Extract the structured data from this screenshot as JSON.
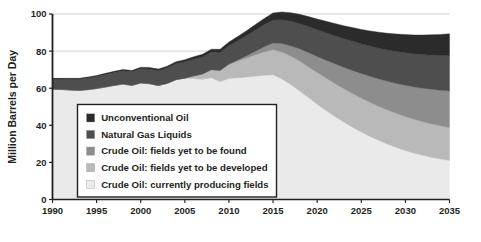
{
  "chart_data": {
    "type": "area",
    "stacked": true,
    "title": "",
    "subtitle": "",
    "xlabel": "",
    "ylabel": "Million Barrels per Day",
    "xlim": [
      1990,
      2035
    ],
    "ylim": [
      0,
      100
    ],
    "ytick_labels": [
      "0",
      "20",
      "40",
      "60",
      "80",
      "100"
    ],
    "ytick_values": [
      0,
      20,
      40,
      60,
      80,
      100
    ],
    "xtick_labels": [
      "1990",
      "1995",
      "2000",
      "2005",
      "2010",
      "2015",
      "2020",
      "2025",
      "2030",
      "2035"
    ],
    "xtick_values": [
      1990,
      1995,
      2000,
      2005,
      2010,
      2015,
      2020,
      2025,
      2030,
      2035
    ],
    "grid": "horizontal",
    "legend_position": "inside-lower-left",
    "x": [
      1990,
      1991,
      1992,
      1993,
      1994,
      1995,
      1996,
      1997,
      1998,
      1999,
      2000,
      2001,
      2002,
      2003,
      2004,
      2005,
      2006,
      2007,
      2008,
      2009,
      2010,
      2011,
      2012,
      2013,
      2014,
      2015,
      2016,
      2017,
      2018,
      2019,
      2020,
      2021,
      2022,
      2023,
      2024,
      2025,
      2026,
      2027,
      2028,
      2029,
      2030,
      2031,
      2032,
      2033,
      2034,
      2035
    ],
    "series": [
      {
        "name": "Crude Oil: currently producing fields",
        "color": "#eaeaea",
        "values": [
          59.5,
          59.3,
          59.0,
          58.8,
          59.2,
          59.8,
          60.6,
          61.5,
          62.2,
          61.5,
          62.8,
          62.4,
          61.4,
          62.6,
          64.6,
          65.4,
          65.2,
          64.8,
          65.6,
          63.6,
          65.2,
          65.6,
          66.0,
          66.5,
          67.0,
          67.2,
          65.0,
          62.0,
          58.6,
          55.0,
          51.4,
          48.0,
          44.8,
          41.8,
          39.0,
          36.4,
          34.0,
          31.8,
          29.8,
          28.0,
          26.4,
          25.0,
          23.8,
          22.7,
          21.8,
          21.0
        ]
      },
      {
        "name": "Crude Oil: fields yet to be developed",
        "color": "#b9b9b9",
        "values": [
          0,
          0,
          0,
          0,
          0,
          0,
          0,
          0,
          0,
          0,
          0,
          0,
          0,
          0,
          0,
          0,
          1.4,
          2.8,
          4.4,
          6.0,
          7.6,
          9.0,
          10.3,
          11.5,
          12.6,
          13.6,
          14.5,
          15.3,
          16.0,
          16.6,
          17.1,
          17.5,
          17.8,
          18.0,
          18.2,
          18.3,
          18.4,
          18.4,
          18.4,
          18.4,
          18.3,
          18.2,
          18.1,
          18.0,
          17.9,
          17.8
        ]
      },
      {
        "name": "Crude Oil: fields yet to be found",
        "color": "#8d8d8d",
        "values": [
          0,
          0,
          0,
          0,
          0,
          0,
          0,
          0,
          0,
          0,
          0,
          0,
          0,
          0,
          0,
          0,
          0,
          0,
          0,
          0,
          0.2,
          0.6,
          1.2,
          1.9,
          2.7,
          3.6,
          4.6,
          5.6,
          6.6,
          7.6,
          8.6,
          9.6,
          10.6,
          11.5,
          12.4,
          13.2,
          14.0,
          14.8,
          15.5,
          16.2,
          16.9,
          17.5,
          18.1,
          18.7,
          19.2,
          19.7
        ]
      },
      {
        "name": "Natural Gas Liquids",
        "color": "#4e4e4e",
        "values": [
          5.5,
          5.7,
          5.9,
          6.1,
          6.3,
          6.5,
          6.8,
          7.0,
          7.2,
          7.4,
          7.7,
          7.9,
          8.0,
          8.3,
          8.6,
          8.8,
          9.0,
          9.2,
          9.4,
          9.6,
          9.9,
          10.4,
          10.9,
          11.4,
          11.9,
          12.4,
          12.8,
          13.2,
          13.6,
          14.0,
          14.4,
          14.8,
          15.1,
          15.4,
          15.7,
          16.0,
          16.3,
          16.6,
          16.9,
          17.2,
          17.5,
          17.8,
          18.1,
          18.4,
          18.7,
          19.0
        ]
      },
      {
        "name": "Unconventional Oil",
        "color": "#2b2b2b",
        "values": [
          0.3,
          0.3,
          0.4,
          0.4,
          0.5,
          0.5,
          0.6,
          0.6,
          0.7,
          0.7,
          0.8,
          0.9,
          0.9,
          1.0,
          1.1,
          1.2,
          1.3,
          1.5,
          1.6,
          1.8,
          2.0,
          2.3,
          2.6,
          3.0,
          3.4,
          3.8,
          4.2,
          4.6,
          5.0,
          5.4,
          5.8,
          6.2,
          6.6,
          7.0,
          7.4,
          7.8,
          8.2,
          8.6,
          9.0,
          9.4,
          9.8,
          10.2,
          10.6,
          11.0,
          11.4,
          11.8
        ]
      }
    ],
    "legend_entries": [
      {
        "label": "Unconventional Oil",
        "color": "#2b2b2b"
      },
      {
        "label": "Natural Gas Liquids",
        "color": "#4e4e4e"
      },
      {
        "label": "Crude Oil: fields yet to be found",
        "color": "#8d8d8d"
      },
      {
        "label": "Crude Oil: fields yet to be developed",
        "color": "#b9b9b9"
      },
      {
        "label": "Crude Oil: currently producing fields",
        "color": "#eaeaea"
      }
    ]
  },
  "style": {
    "axis_color": "#231f20",
    "grid_color": "#c9c9c9",
    "plot_background": "#ffffff",
    "legend_border_color": "#231f20",
    "legend_background": "#ffffff"
  }
}
